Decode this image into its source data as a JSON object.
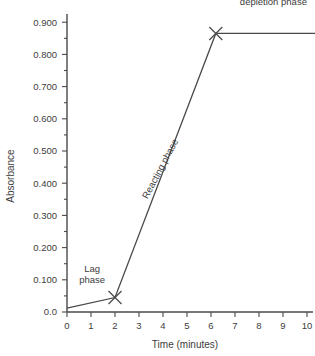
{
  "chart_data": {
    "type": "line",
    "title": "",
    "xlabel": "Time (minutes)",
    "ylabel": "Absorbance",
    "xlim": [
      0,
      10.5
    ],
    "ylim": [
      0.0,
      0.93
    ],
    "grid": false,
    "legend": "none",
    "x_ticks": [
      "0",
      "1",
      "2",
      "3",
      "4",
      "5",
      "6",
      "7",
      "8",
      "9",
      "10"
    ],
    "x_tick_values": [
      0,
      1,
      2,
      3,
      4,
      5,
      6,
      7,
      8,
      9,
      10
    ],
    "y_ticks": [
      "0.0",
      "0.100",
      "0.200",
      "0.300",
      "0.400",
      "0.500",
      "0.600",
      "0.700",
      "0.800",
      "0.900"
    ],
    "y_tick_values": [
      0.0,
      0.1,
      0.2,
      0.3,
      0.4,
      0.5,
      0.6,
      0.7,
      0.8,
      0.9
    ],
    "series": [
      {
        "name": "Absorbance curve",
        "x": [
          0,
          2.0,
          6.2,
          10.5
        ],
        "values": [
          0.012,
          0.045,
          0.865,
          0.865
        ]
      }
    ],
    "markers": [
      {
        "name": "lag-to-reacting-transition",
        "shape": "x",
        "x": 2.0,
        "y": 0.045
      },
      {
        "name": "reacting-to-depletion-transition",
        "shape": "x",
        "x": 6.2,
        "y": 0.865
      }
    ],
    "annotations": [
      {
        "name": "lag-phase",
        "lines": [
          "Lag",
          "phase"
        ],
        "x": 1.05,
        "y": 0.125
      },
      {
        "name": "reacting-phase",
        "lines": [
          "Reacting phase"
        ],
        "x": 4.0,
        "y": 0.44,
        "rotation": -62
      },
      {
        "name": "substrate-depletion-phase",
        "lines": [
          "Substrate",
          "depletion phase"
        ],
        "x": 8.6,
        "y": 0.99
      }
    ]
  }
}
